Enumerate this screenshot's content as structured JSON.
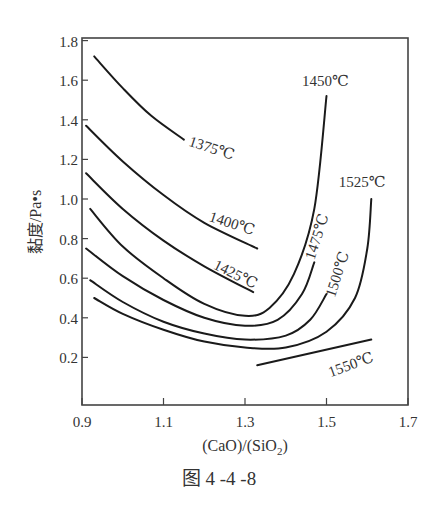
{
  "figure": {
    "caption": "图 4 -4 -8"
  },
  "chart_data": {
    "type": "line",
    "title": "",
    "xlabel": "(CaO)/(SiO2)",
    "ylabel": "黏度/Pa•s",
    "xlim": [
      0.9,
      1.7
    ],
    "ylim": [
      0.0,
      1.8
    ],
    "x_ticks": [
      "0.9",
      "1.1",
      "1.3",
      "1.5",
      "1.7"
    ],
    "y_ticks": [
      "0.2",
      "0.4",
      "0.6",
      "0.8",
      "1.0",
      "1.2",
      "1.4",
      "1.6",
      "1.8"
    ],
    "grid": false,
    "legend": "inline curve labels",
    "series": [
      {
        "name": "1375℃",
        "x": [
          0.93,
          1.0,
          1.07,
          1.15
        ],
        "y": [
          1.72,
          1.56,
          1.42,
          1.3
        ]
      },
      {
        "name": "1400℃",
        "x": [
          0.91,
          1.0,
          1.1,
          1.2,
          1.33
        ],
        "y": [
          1.37,
          1.19,
          1.02,
          0.88,
          0.75
        ]
      },
      {
        "name": "1425℃",
        "x": [
          0.91,
          1.0,
          1.1,
          1.2,
          1.32
        ],
        "y": [
          1.13,
          0.95,
          0.79,
          0.66,
          0.53
        ]
      },
      {
        "name": "1450℃",
        "x": [
          0.92,
          1.0,
          1.1,
          1.2,
          1.3,
          1.36,
          1.42,
          1.47,
          1.5
        ],
        "y": [
          0.95,
          0.76,
          0.6,
          0.47,
          0.41,
          0.45,
          0.62,
          0.95,
          1.52
        ]
      },
      {
        "name": "1475℃",
        "x": [
          0.91,
          1.0,
          1.1,
          1.2,
          1.3,
          1.38,
          1.44,
          1.47
        ],
        "y": [
          0.75,
          0.61,
          0.49,
          0.4,
          0.36,
          0.39,
          0.52,
          0.68
        ]
      },
      {
        "name": "1500℃",
        "x": [
          0.92,
          1.0,
          1.1,
          1.2,
          1.3,
          1.4,
          1.46,
          1.5
        ],
        "y": [
          0.59,
          0.48,
          0.38,
          0.32,
          0.29,
          0.31,
          0.39,
          0.52
        ]
      },
      {
        "name": "1525℃",
        "x": [
          0.93,
          1.0,
          1.1,
          1.2,
          1.3,
          1.4,
          1.5,
          1.57,
          1.6,
          1.61
        ],
        "y": [
          0.5,
          0.42,
          0.34,
          0.28,
          0.25,
          0.25,
          0.33,
          0.5,
          0.75,
          1.0
        ]
      },
      {
        "name": "1550℃",
        "x": [
          1.33,
          1.61
        ],
        "y": [
          0.16,
          0.29
        ]
      }
    ],
    "curve_labels": [
      {
        "text": "1375℃",
        "x": 1.16,
        "y": 1.27,
        "rotate": 18
      },
      {
        "text": "1400℃",
        "x": 1.21,
        "y": 0.89,
        "rotate": 18
      },
      {
        "text": "1425℃",
        "x": 1.22,
        "y": 0.65,
        "rotate": 26
      },
      {
        "text": "1450℃",
        "x": 1.44,
        "y": 1.57,
        "rotate": 0
      },
      {
        "text": "1475℃",
        "x": 1.47,
        "y": 0.69,
        "rotate": -72
      },
      {
        "text": "1500℃",
        "x": 1.52,
        "y": 0.5,
        "rotate": -72
      },
      {
        "text": "1525℃",
        "x": 1.53,
        "y": 1.06,
        "rotate": 0
      },
      {
        "text": "1550℃",
        "x": 1.51,
        "y": 0.1,
        "rotate": -20
      }
    ]
  }
}
